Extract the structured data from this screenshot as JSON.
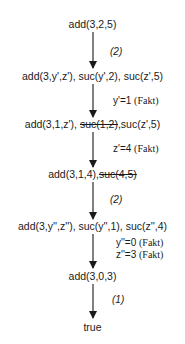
{
  "diagram": {
    "nodes": [
      {
        "id": "n1",
        "parts": [
          {
            "text": "add(3,2,5)",
            "struck": false
          }
        ]
      },
      {
        "id": "n2",
        "parts": [
          {
            "text": "add(3,y',z'), suc(y',2), suc(z',5)",
            "struck": false
          }
        ]
      },
      {
        "id": "n3",
        "parts": [
          {
            "text": "add(3,1,z'), ",
            "struck": false
          },
          {
            "text": "suc(1,2)",
            "struck": true
          },
          {
            "text": ",suc(z',5)",
            "struck": false
          }
        ]
      },
      {
        "id": "n4",
        "parts": [
          {
            "text": "add(3,1,4),",
            "struck": false
          },
          {
            "text": "suc(4,5)",
            "struck": true
          }
        ]
      },
      {
        "id": "n5",
        "parts": [
          {
            "text": "add(3,y'',z''), suc(y'',1), suc(z'',4)",
            "struck": false
          }
        ]
      },
      {
        "id": "n6",
        "parts": [
          {
            "text": "add(3,0,3)",
            "struck": false
          }
        ]
      },
      {
        "id": "n7",
        "parts": [
          {
            "text": "true",
            "struck": false
          }
        ]
      }
    ],
    "edges": [
      {
        "from": "n1",
        "to": "n2",
        "labels": [
          {
            "main": "(2)",
            "note": ""
          }
        ]
      },
      {
        "from": "n2",
        "to": "n3",
        "labels": [
          {
            "main": "y'=1",
            "note": "(Fakt)"
          }
        ]
      },
      {
        "from": "n3",
        "to": "n4",
        "labels": [
          {
            "main": "z'=4",
            "note": "(Fakt)"
          }
        ]
      },
      {
        "from": "n4",
        "to": "n5",
        "labels": [
          {
            "main": "(2)",
            "note": ""
          }
        ]
      },
      {
        "from": "n5",
        "to": "n6",
        "labels": [
          {
            "main": "y''=0",
            "note": "(Fakt)"
          },
          {
            "main": "z''=3",
            "note": "(Fakt)"
          }
        ]
      },
      {
        "from": "n6",
        "to": "n7",
        "labels": [
          {
            "main": "(1)",
            "note": ""
          }
        ]
      }
    ]
  }
}
